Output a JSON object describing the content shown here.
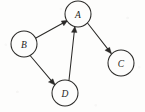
{
  "diagram": {
    "type": "directed-graph",
    "width": 145,
    "height": 112,
    "background_color": "#fdfdfc",
    "ink_color": "#2b2a28",
    "node_radius": 13,
    "nodes": [
      {
        "id": "A",
        "label": "A",
        "cx": 78,
        "cy": 14
      },
      {
        "id": "B",
        "label": "B",
        "cx": 24,
        "cy": 44
      },
      {
        "id": "C",
        "label": "C",
        "cx": 121,
        "cy": 63
      },
      {
        "id": "D",
        "label": "D",
        "cx": 65,
        "cy": 93
      }
    ],
    "edges": [
      {
        "id": "B-A",
        "from": "B",
        "to": "A",
        "directed": true,
        "arrow_at": "A"
      },
      {
        "id": "B-D",
        "from": "B",
        "to": "D",
        "directed": true,
        "arrow_at": "D"
      },
      {
        "id": "D-A",
        "from": "D",
        "to": "A",
        "directed": true,
        "arrow_at": "A"
      },
      {
        "id": "A-C",
        "from": "A",
        "to": "C",
        "directed": true,
        "arrow_at": "C"
      }
    ]
  }
}
